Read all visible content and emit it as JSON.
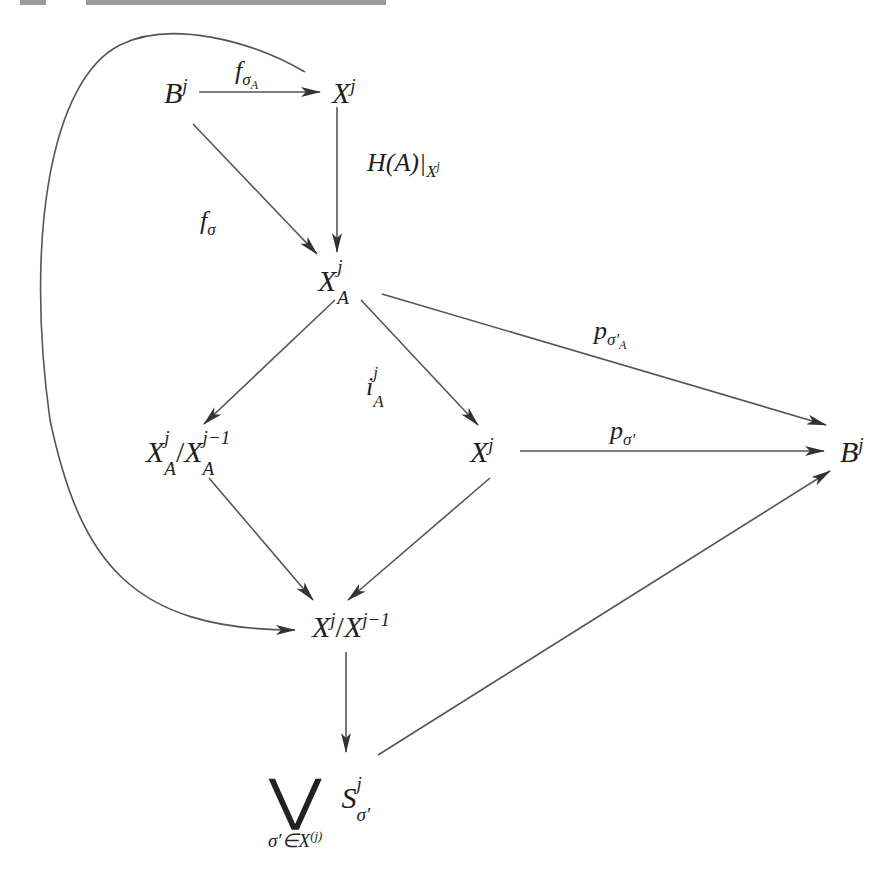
{
  "diagram": {
    "type": "commutative-diagram",
    "nodes": {
      "B_top": {
        "base": "B",
        "sup": "j"
      },
      "X_top": {
        "base": "X",
        "sup": "j"
      },
      "XA": {
        "base": "X",
        "sup": "j",
        "sub": "A"
      },
      "XA_quot": {
        "base1": "X",
        "sup1": "j",
        "sub1": "A",
        "slash": "/",
        "base2": "X",
        "sup2": "j−1",
        "sub2": "A"
      },
      "X_mid": {
        "base": "X",
        "sup": "j"
      },
      "B_right": {
        "base": "B",
        "sup": "j"
      },
      "X_quot": {
        "base1": "X",
        "sup1": "j",
        "slash": "/",
        "base2": "X",
        "sup2": "j−1"
      },
      "wedge": {
        "operator": "⋁",
        "index": "σ′∈X",
        "index_sup": "(j)",
        "base": "S",
        "sup": "j",
        "sub": "σ′"
      }
    },
    "edge_labels": {
      "f_sigma_A": {
        "base": "f",
        "sub": "σ",
        "subsub": "A"
      },
      "H_restrict": {
        "text": "H(A)|",
        "sub": "X",
        "subsup": "j"
      },
      "f_sigma": {
        "base": "f",
        "sub": "σ"
      },
      "p_sigma_prime_A": {
        "base": "p",
        "sub": "σ′",
        "subsub": "A"
      },
      "i_A": {
        "base": "i",
        "sup": "j",
        "sub": "A"
      },
      "p_sigma_prime": {
        "base": "p",
        "sub": "σ′"
      }
    },
    "edges": [
      {
        "from": "B_top",
        "to": "X_top",
        "label": "f_sigma_A"
      },
      {
        "from": "X_top",
        "to": "XA",
        "label": "H_restrict"
      },
      {
        "from": "B_top",
        "to": "XA",
        "label": "f_sigma"
      },
      {
        "from": "XA",
        "to": "B_right",
        "label": "p_sigma_prime_A"
      },
      {
        "from": "XA",
        "to": "XA_quot",
        "label": ""
      },
      {
        "from": "XA",
        "to": "X_mid",
        "label": "i_A"
      },
      {
        "from": "X_mid",
        "to": "B_right",
        "label": "p_sigma_prime"
      },
      {
        "from": "XA_quot",
        "to": "X_quot",
        "label": ""
      },
      {
        "from": "X_mid",
        "to": "X_quot",
        "label": ""
      },
      {
        "from": "X_top",
        "to": "X_quot",
        "label": "",
        "curved": true
      },
      {
        "from": "X_quot",
        "to": "wedge",
        "label": ""
      },
      {
        "from": "wedge",
        "to": "B_right",
        "label": ""
      }
    ],
    "colors": {
      "stroke": "#444444",
      "text": "#1e1e1e",
      "background": "#ffffff"
    }
  }
}
